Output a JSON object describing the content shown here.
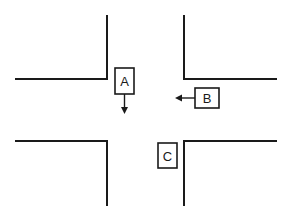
{
  "diagram": {
    "type": "intersection",
    "colors": {
      "line": "#1a1a1a",
      "background": "#ffffff"
    },
    "vehicles": [
      {
        "id": "A",
        "label": "A",
        "direction": "down",
        "position": "north approach, entering intersection"
      },
      {
        "id": "B",
        "label": "B",
        "direction": "left",
        "position": "east approach"
      },
      {
        "id": "C",
        "label": "C",
        "direction": "none",
        "position": "south approach"
      }
    ]
  }
}
